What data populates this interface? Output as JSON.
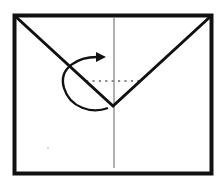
{
  "diagram": {
    "type": "origami-fold-step",
    "colors": {
      "background": "#ffffff",
      "outline": "#111111",
      "crease": "#b0b0b0",
      "dotted_fold_line": "#8a8a8a",
      "arrow": "#111111"
    },
    "elements": {
      "paper_outline": "square-border",
      "diagonal_folds": [
        "left-diagonal",
        "right-diagonal"
      ],
      "center_crease": "vertical-crease",
      "fold_line": "dotted-horizontal",
      "arrow": "curved-fold-arrow"
    }
  }
}
